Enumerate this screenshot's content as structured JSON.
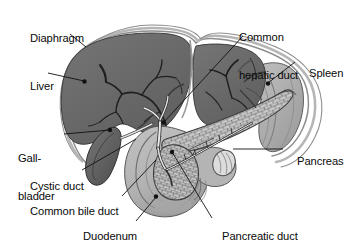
{
  "figure": {
    "background_color": "#ffffff",
    "text_color": "#0a0a0a"
  },
  "palette": {
    "liver": "#6b6b6b",
    "liver_dark_edge": "#4a4a4a",
    "diaphragm": "#d8d8d8",
    "diaphragm_line": "#8e8e8e",
    "gallbladder": "#5f5f5f",
    "spleen": "#b0b0b0",
    "spleen_shade": "#9a9a9a",
    "duodenum": "#b5b5b5",
    "duodenum_shade": "#9d9d9d",
    "pancreas": "#c9c9c9",
    "pancreas_outline": "#4f4f4f",
    "duct": "#e6e6e6",
    "duct_outline": "#3a3a3a",
    "vessel": "#2c2c2c",
    "leader": "#111111"
  },
  "labels": [
    {
      "id": "diaphragm",
      "text": "Diaphragm",
      "lines": [
        "Diaphragm"
      ],
      "x": 18,
      "y": 20,
      "align": "left"
    },
    {
      "id": "liver",
      "text": "Liver",
      "lines": [
        "Liver"
      ],
      "x": 18,
      "y": 68,
      "align": "left"
    },
    {
      "id": "gallbladder",
      "text": "Gall-bladder",
      "lines": [
        "Gall-",
        "bladder"
      ],
      "x": 18,
      "y": 128,
      "align": "left"
    },
    {
      "id": "cystic-duct",
      "text": "Cystic duct",
      "lines": [
        "Cystic duct"
      ],
      "x": 18,
      "y": 169,
      "align": "left"
    },
    {
      "id": "common-bile-duct",
      "text": "Common bile duct",
      "lines": [
        "Common bile duct"
      ],
      "x": 18,
      "y": 194,
      "align": "left"
    },
    {
      "id": "duodenum",
      "text": "Duodenum",
      "lines": [
        "Duodenum"
      ],
      "x": 71,
      "y": 219,
      "align": "left"
    },
    {
      "id": "common-hepatic-duct",
      "text": "Common hepatic duct",
      "lines": [
        "Common",
        "hepatic duct"
      ],
      "x": 239,
      "y": 7,
      "align": "left"
    },
    {
      "id": "spleen",
      "text": "Spleen",
      "lines": [
        "Spleen"
      ],
      "x": 297,
      "y": 56,
      "align": "left"
    },
    {
      "id": "pancreas",
      "text": "Pancreas",
      "lines": [
        "Pancreas"
      ],
      "x": 285,
      "y": 144,
      "align": "left"
    },
    {
      "id": "pancreatic-duct",
      "text": "Pancreatic duct",
      "lines": [
        "Pancreatic duct"
      ],
      "x": 210,
      "y": 219,
      "align": "left"
    }
  ],
  "leaders": [
    {
      "id": "diaphragm",
      "path": "M 70,34 L 86,47",
      "dot": null
    },
    {
      "id": "liver",
      "path": "M 48,73 L 84,81",
      "dot": [
        84.5,
        81.5
      ]
    },
    {
      "id": "gallbladder",
      "path": "M 64,134 L 110,130",
      "dot": [
        110,
        130
      ]
    },
    {
      "id": "cystic-duct",
      "path": "M 82,170 L 136,139",
      "dot": null
    },
    {
      "id": "common-bile-duct",
      "path": "M 122,196 L 156,160",
      "dot": null
    },
    {
      "id": "duodenum",
      "path": "M 136,221 L 156,197",
      "dot": [
        156,
        196.5
      ]
    },
    {
      "id": "common-hepatic-duct",
      "path": "M 243,36 L 164,122",
      "dot": [
        163.5,
        122.5
      ]
    },
    {
      "id": "spleen",
      "path": "M 295,62 L 268,83",
      "dot": [
        268,
        83.5
      ]
    },
    {
      "id": "pancreas",
      "path": "M 283,149 L 233,149",
      "dot": null
    },
    {
      "id": "pancreatic-duct",
      "path": "M 212,218 L 172,152",
      "dot": [
        172,
        152
      ]
    }
  ]
}
